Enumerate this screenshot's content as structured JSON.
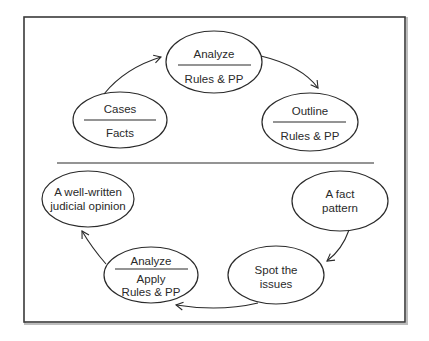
{
  "diagram": {
    "top_cycle": {
      "nodes": [
        {
          "id": "analyze-top",
          "top": "Analyze",
          "bottom": "Rules & PP"
        },
        {
          "id": "cases",
          "top": "Cases",
          "bottom": "Facts"
        },
        {
          "id": "outline",
          "top": "Outline",
          "bottom": "Rules & PP"
        }
      ]
    },
    "bottom_cycle": {
      "nodes": [
        {
          "id": "opinion",
          "line1": "A well-written",
          "line2": "judicial opinion"
        },
        {
          "id": "fact-pattern",
          "line1": "A fact",
          "line2": "pattern"
        },
        {
          "id": "analyze-apply",
          "top": "Analyze",
          "line1": "Apply",
          "line2": "Rules & PP"
        },
        {
          "id": "spot-issues",
          "line1": "Spot the",
          "line2": "issues"
        }
      ]
    },
    "colors": {
      "stroke": "#2a2a2a",
      "frame": "#3a3a3a",
      "background": "#ffffff"
    }
  }
}
